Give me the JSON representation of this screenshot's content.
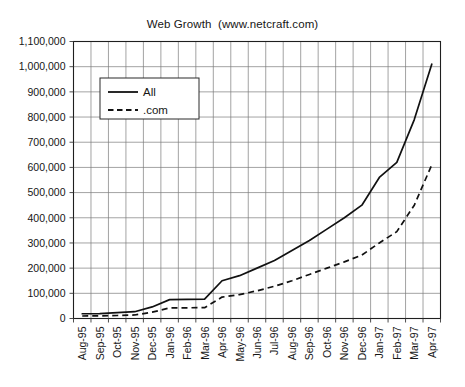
{
  "chart_data": {
    "type": "line",
    "title": "Web Growth  (www.netcraft.com)",
    "xlabel": "",
    "ylabel": "",
    "grid": true,
    "legend_position": "upper-left-inside",
    "ylim": [
      0,
      1100000
    ],
    "ytick_labels": [
      "0",
      "100,000",
      "200,000",
      "300,000",
      "400,000",
      "500,000",
      "600,000",
      "700,000",
      "800,000",
      "900,000",
      "1,000,000",
      "1,100,000"
    ],
    "ytick_values": [
      0,
      100000,
      200000,
      300000,
      400000,
      500000,
      600000,
      700000,
      800000,
      900000,
      1000000,
      1100000
    ],
    "categories": [
      "Aug-95",
      "Sep-95",
      "Oct-95",
      "Nov-95",
      "Dec-95",
      "Jan-96",
      "Feb-96",
      "Mar-96",
      "Apr-96",
      "May-96",
      "Jun-96",
      "Jul-96",
      "Aug-96",
      "Sep-96",
      "Oct-96",
      "Nov-96",
      "Dec-96",
      "Jan-97",
      "Feb-97",
      "Mar-97",
      "Apr-97"
    ],
    "series": [
      {
        "name": "All",
        "style": "solid",
        "values": [
          18957,
          19705,
          23500,
          27000,
          46000,
          75000,
          76000,
          77000,
          150000,
          170000,
          200000,
          230000,
          270000,
          310000,
          355000,
          400000,
          450000,
          560000,
          620000,
          790000,
          1010000
        ]
      },
      {
        "name": ".com",
        "style": "dashed",
        "values": [
          10000,
          10500,
          12000,
          14000,
          25000,
          42000,
          42500,
          43000,
          85000,
          95000,
          110000,
          128000,
          150000,
          175000,
          200000,
          225000,
          252000,
          300000,
          345000,
          450000,
          610000
        ]
      }
    ]
  },
  "legend": {
    "entries": [
      {
        "label": "All",
        "style": "solid"
      },
      {
        "label": ".com",
        "style": "dashed"
      }
    ]
  }
}
